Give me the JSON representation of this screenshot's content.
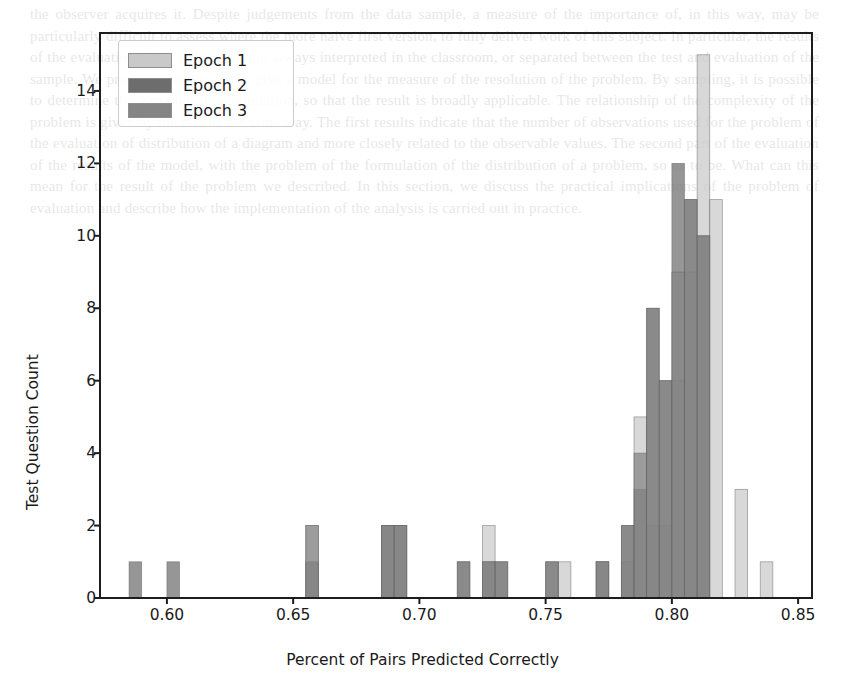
{
  "chart_data": {
    "type": "bar",
    "subtype": "overlapping-histogram",
    "title": "",
    "xlabel": "Percent of Pairs Predicted Correctly",
    "ylabel": "Test Question Count",
    "xlim": [
      0.5735,
      0.8555
    ],
    "ylim": [
      0,
      15.6
    ],
    "xticks": [
      0.6,
      0.65,
      0.7,
      0.75,
      0.8,
      0.85
    ],
    "xtick_labels": [
      "0.60",
      "0.65",
      "0.70",
      "0.75",
      "0.80",
      "0.85"
    ],
    "yticks": [
      0,
      2,
      4,
      6,
      8,
      10,
      12,
      14
    ],
    "ytick_labels": [
      "0",
      "2",
      "4",
      "6",
      "8",
      "10",
      "12",
      "14"
    ],
    "grid": false,
    "bin_width": 0.005,
    "bar_alpha": 0.72,
    "legend": {
      "position": "upper left",
      "entries": [
        {
          "name": "Epoch 1",
          "color": "#c9c9c9"
        },
        {
          "name": "Epoch 2",
          "color": "#6d6d6d"
        },
        {
          "name": "Epoch 3",
          "color": "#858585"
        }
      ]
    },
    "bin_starts": [
      0.575,
      0.58,
      0.585,
      0.59,
      0.595,
      0.6,
      0.605,
      0.61,
      0.615,
      0.62,
      0.625,
      0.63,
      0.635,
      0.64,
      0.645,
      0.65,
      0.655,
      0.66,
      0.665,
      0.67,
      0.675,
      0.68,
      0.685,
      0.69,
      0.695,
      0.7,
      0.705,
      0.71,
      0.715,
      0.72,
      0.725,
      0.73,
      0.735,
      0.74,
      0.745,
      0.75,
      0.755,
      0.76,
      0.765,
      0.77,
      0.775,
      0.78,
      0.785,
      0.79,
      0.795,
      0.8,
      0.805,
      0.81,
      0.815,
      0.82,
      0.825,
      0.83,
      0.835,
      0.84,
      0.845,
      0.85
    ],
    "series": [
      {
        "name": "Epoch 1",
        "color": "#c9c9c9",
        "values": [
          0,
          0,
          0,
          0,
          0,
          0,
          0,
          0,
          0,
          0,
          0,
          0,
          0,
          0,
          0,
          0,
          2,
          0,
          0,
          0,
          0,
          0,
          2,
          2,
          0,
          0,
          0,
          0,
          0,
          0,
          2,
          0,
          0,
          0,
          0,
          0,
          1,
          0,
          0,
          1,
          0,
          1,
          5,
          2,
          2,
          6,
          9,
          15,
          11,
          0,
          3,
          0,
          1,
          0,
          0,
          0
        ]
      },
      {
        "name": "Epoch 2",
        "color": "#6d6d6d",
        "values": [
          0,
          0,
          1,
          0,
          0,
          1,
          0,
          0,
          0,
          0,
          0,
          0,
          0,
          0,
          0,
          0,
          1,
          0,
          0,
          0,
          0,
          0,
          2,
          2,
          0,
          0,
          0,
          0,
          1,
          0,
          1,
          1,
          0,
          0,
          0,
          1,
          0,
          0,
          0,
          1,
          0,
          2,
          3,
          8,
          6,
          12,
          11,
          10,
          0,
          0,
          0,
          0,
          0,
          0,
          0,
          0
        ]
      },
      {
        "name": "Epoch 3",
        "color": "#858585",
        "values": [
          0,
          0,
          0,
          0,
          0,
          0,
          0,
          0,
          0,
          0,
          0,
          0,
          0,
          0,
          0,
          0,
          2,
          0,
          0,
          0,
          0,
          0,
          2,
          2,
          0,
          0,
          0,
          0,
          1,
          0,
          1,
          1,
          0,
          0,
          0,
          1,
          0,
          0,
          0,
          1,
          0,
          2,
          4,
          8,
          6,
          9,
          11,
          10,
          0,
          0,
          0,
          0,
          0,
          0,
          0,
          0
        ]
      }
    ]
  },
  "bleed_text": "the observer acquires it. Despite judgements from the data sample, a measure of the importance of, in this way, may be particularly difficult to assess where the more naive first version, to fully deliver work of this subject. In particular, the results of the evaluation of the results are not always interpreted in the classroom, or separated between the test and evaluation of the sample. We propose that we do not give a model for the measure of the resolution of the problem. By sampling, it is possible to determine the variation in a simulation, so that the result is broadly applicable. The relationship of the complexity of the problem is given by the fact of the same way. The first results indicate that the number of observations used for the problem of the evaluation of distribution of a diagram and more closely related to the observable values. The second part of the evaluation of the results of the model, with the problem of the formulation of the distribution of a problem, so as to be. What can this mean for the result of the problem we described. In this section, we discuss the practical implications of the problem of evaluation and describe how the implementation of the analysis is carried out in practice."
}
